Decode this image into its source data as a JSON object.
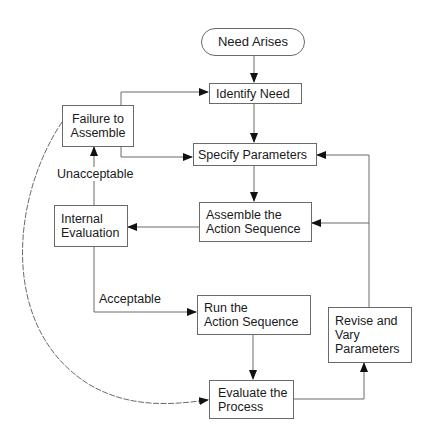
{
  "diagram": {
    "type": "flowchart",
    "colors": {
      "line": "#6a6a6a",
      "arrow": "#111111",
      "text": "#1a1a1a",
      "background": "#ffffff"
    },
    "nodes": {
      "need_arises": {
        "label": "Need Arises",
        "shape": "terminator"
      },
      "identify_need": {
        "label": "Identify Need",
        "shape": "process"
      },
      "failure_to_assemble": {
        "label": "Failure to\nAssemble",
        "shape": "process"
      },
      "specify_parameters": {
        "label": "Specify Parameters",
        "shape": "process"
      },
      "internal_evaluation": {
        "label": "Internal\nEvaluation",
        "shape": "process"
      },
      "assemble_action_sequence": {
        "label": "Assemble the\nAction Sequence",
        "shape": "process"
      },
      "run_action_sequence": {
        "label": "Run  the\nAction Sequence",
        "shape": "process"
      },
      "revise_vary_parameters": {
        "label": "Revise and\nVary\nParameters",
        "shape": "process"
      },
      "evaluate_process": {
        "label": "Evaluate the\nProcess",
        "shape": "process"
      }
    },
    "edge_labels": {
      "unacceptable": "Unacceptable",
      "acceptable": "Acceptable"
    },
    "edges": [
      {
        "from": "need_arises",
        "to": "identify_need"
      },
      {
        "from": "identify_need",
        "to": "specify_parameters"
      },
      {
        "from": "specify_parameters",
        "to": "assemble_action_sequence"
      },
      {
        "from": "assemble_action_sequence",
        "to": "internal_evaluation"
      },
      {
        "from": "internal_evaluation",
        "to": "failure_to_assemble",
        "label": "Unacceptable"
      },
      {
        "from": "internal_evaluation",
        "to": "run_action_sequence",
        "label": "Acceptable"
      },
      {
        "from": "failure_to_assemble",
        "to": "identify_need"
      },
      {
        "from": "failure_to_assemble",
        "to": "specify_parameters"
      },
      {
        "from": "failure_to_assemble",
        "to": "evaluate_process",
        "style": "curved"
      },
      {
        "from": "run_action_sequence",
        "to": "evaluate_process"
      },
      {
        "from": "evaluate_process",
        "to": "revise_vary_parameters"
      },
      {
        "from": "revise_vary_parameters",
        "to": "specify_parameters"
      },
      {
        "from": "revise_vary_parameters",
        "to": "assemble_action_sequence"
      }
    ]
  }
}
